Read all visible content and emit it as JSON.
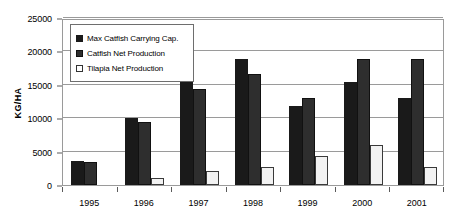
{
  "chart_data": {
    "type": "bar",
    "title": "",
    "xlabel": "",
    "ylabel": "KG/HA",
    "ylim": [
      0,
      25000
    ],
    "yticks": [
      0,
      5000,
      10000,
      15000,
      20000,
      25000
    ],
    "ytick_labels": [
      "0",
      "5000",
      "10000",
      "15000",
      "20000",
      "25000"
    ],
    "grid": true,
    "legend_position": "upper-left-inside",
    "categories": [
      "1995",
      "1996",
      "1997",
      "1998",
      "1999",
      "2000",
      "2001"
    ],
    "series": [
      {
        "name": "Max Catfish Carrying Cap.",
        "color": "#1a1a1a",
        "values": [
          3600,
          10000,
          15700,
          18900,
          11800,
          15400,
          13100
        ]
      },
      {
        "name": "Catfish Net Production",
        "color": "#2e2e2e",
        "values": [
          3500,
          9400,
          14300,
          16600,
          13000,
          18900,
          18900
        ]
      },
      {
        "name": "Tilapia Net Production",
        "color": "#ffffff",
        "values": [
          0,
          1000,
          2100,
          2700,
          4300,
          6000,
          2700
        ]
      }
    ]
  }
}
